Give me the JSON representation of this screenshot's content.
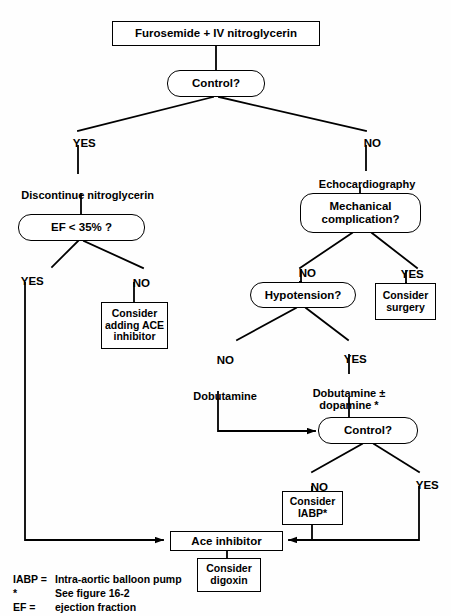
{
  "figure": {
    "type": "clinical-decision-flowchart"
  },
  "nodes": {
    "furosemide": {
      "label": "Furosemide  +  IV nitroglycerin",
      "shape": "rect"
    },
    "control_top": {
      "label": "Control?",
      "shape": "pill"
    },
    "ef": {
      "label": "EF  <  35% ?",
      "shape": "pill"
    },
    "mechanical": {
      "label": "Mechanical\ncomplication?",
      "shape": "pill"
    },
    "hypotension": {
      "label": "Hypotension?",
      "shape": "pill"
    },
    "consider_ace": {
      "label": "Consider\nadding ACE\ninhibitor",
      "shape": "rect"
    },
    "consider_surgery": {
      "label": "Consider\nsurgery",
      "shape": "rect"
    },
    "control_bottom": {
      "label": "Control?",
      "shape": "pill"
    },
    "consider_iabp": {
      "label": "Consider\nIABP*",
      "shape": "rect"
    },
    "ace_inhibitor": {
      "label": "Ace inhibitor",
      "shape": "rect"
    },
    "consider_digoxin": {
      "label": "Consider\ndigoxin",
      "shape": "rect"
    }
  },
  "labels": {
    "yes_top": "YES",
    "no_top": "NO",
    "discontinue": "Discontinue nitroglycerin",
    "echocardiography": "Echocardiography",
    "yes_ef": "YES",
    "no_ef": "NO",
    "no_mech": "NO",
    "yes_mech": "YES",
    "no_hypo": "NO",
    "yes_hypo": "YES",
    "dobutamine": "Dobutamine",
    "dobutamine_dopamine": "Dobutamine ±\ndopamine *",
    "no_control_bottom": "NO",
    "yes_control_bottom": "YES"
  },
  "legend": {
    "rows": [
      {
        "key": "IABP =",
        "text": "Intra-aortic balloon pump"
      },
      {
        "key": "*",
        "text": "See figure 16-2"
      },
      {
        "key": "EF =",
        "text": "ejection fraction"
      }
    ]
  },
  "colors": {
    "stroke": "#000000",
    "background": "#fefefe",
    "text": "#000000"
  }
}
